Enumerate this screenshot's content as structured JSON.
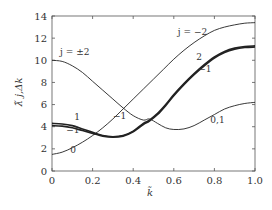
{
  "chart_data": {
    "type": "line",
    "title": "",
    "xlabel": "k̃",
    "ylabel": "λ̃ j,Δk",
    "xlim": [
      0,
      1.0
    ],
    "ylim": [
      0,
      14
    ],
    "xticks": [
      "0",
      "0.2",
      "0.4",
      "0.6",
      "0.8",
      "1.0"
    ],
    "yticks": [
      "0",
      "2",
      "4",
      "6",
      "8",
      "10",
      "12",
      "14"
    ],
    "grid": false,
    "series": [
      {
        "name": "j = ±2 → 0,1",
        "weight": "thin",
        "x": [
          0,
          0.05,
          0.1,
          0.15,
          0.2,
          0.25,
          0.3,
          0.35,
          0.4,
          0.45,
          0.48,
          0.52,
          0.56,
          0.6,
          0.65,
          0.7,
          0.75,
          0.8,
          0.85,
          0.9,
          0.95,
          1.0
        ],
        "y": [
          10.0,
          9.9,
          9.5,
          8.9,
          8.1,
          7.3,
          6.5,
          5.7,
          5.0,
          4.6,
          4.7,
          4.3,
          3.9,
          3.75,
          3.8,
          4.1,
          4.6,
          5.1,
          5.6,
          5.9,
          6.1,
          6.2
        ]
      },
      {
        "name": "j = 0 → −2",
        "weight": "thin",
        "x": [
          0,
          0.05,
          0.1,
          0.15,
          0.2,
          0.25,
          0.3,
          0.35,
          0.4,
          0.45,
          0.5,
          0.55,
          0.6,
          0.65,
          0.7,
          0.75,
          0.8,
          0.85,
          0.9,
          0.95,
          1.0
        ],
        "y": [
          1.5,
          1.7,
          2.1,
          2.6,
          3.2,
          3.9,
          4.7,
          5.6,
          6.5,
          7.4,
          8.3,
          9.2,
          10.1,
          10.9,
          11.6,
          12.2,
          12.7,
          13.0,
          13.2,
          13.35,
          13.4
        ]
      },
      {
        "name": "j = 1 → 2",
        "weight": "thick",
        "x": [
          0,
          0.05,
          0.1,
          0.15,
          0.2,
          0.25,
          0.3,
          0.35,
          0.4,
          0.45,
          0.48,
          0.52,
          0.56,
          0.6,
          0.65,
          0.7,
          0.75,
          0.8,
          0.85,
          0.9,
          0.95,
          1.0
        ],
        "y": [
          4.3,
          4.25,
          4.1,
          3.8,
          3.5,
          3.2,
          3.1,
          3.2,
          3.6,
          4.3,
          4.6,
          5.2,
          6.0,
          6.9,
          7.9,
          8.8,
          9.6,
          10.3,
          10.8,
          11.1,
          11.25,
          11.3
        ]
      },
      {
        "name": "j = −1 → −1",
        "weight": "thick",
        "x": [
          0,
          0.05,
          0.1,
          0.15,
          0.2,
          0.25,
          0.3,
          0.35,
          0.4,
          0.45,
          0.48,
          0.52,
          0.56,
          0.6,
          0.65,
          0.7,
          0.75,
          0.8,
          0.85,
          0.9,
          0.95,
          1.0
        ],
        "y": [
          4.1,
          4.05,
          3.9,
          3.65,
          3.4,
          3.15,
          3.05,
          3.15,
          3.55,
          4.2,
          4.5,
          5.1,
          5.9,
          6.8,
          7.8,
          8.7,
          9.5,
          10.2,
          10.7,
          11.0,
          11.15,
          11.2
        ]
      }
    ],
    "annotations": [
      {
        "text": "j = ±2",
        "x": 0.04,
        "y": 10.5
      },
      {
        "text": "j = −2",
        "x": 0.62,
        "y": 12.3
      },
      {
        "text": "2",
        "x": 0.71,
        "y": 10.0
      },
      {
        "text": "−1",
        "x": 0.72,
        "y": 8.9
      },
      {
        "text": "1",
        "x": 0.11,
        "y": 4.6
      },
      {
        "text": "−1",
        "x": 0.07,
        "y": 3.4
      },
      {
        "text": "−1",
        "x": 0.3,
        "y": 4.7
      },
      {
        "text": "0",
        "x": 0.09,
        "y": 1.6
      },
      {
        "text": "0,1",
        "x": 0.78,
        "y": 4.3
      }
    ]
  }
}
